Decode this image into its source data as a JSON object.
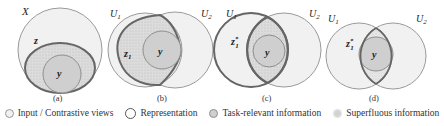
{
  "colors": {
    "input_fill": "#f1f1f1",
    "input_stroke": "#9a9a9a",
    "representation_stroke": "#666666",
    "task_fill": "#cfcfcf",
    "task_stroke": "#8f8f8f",
    "superfluous_fill": "#dedede"
  },
  "panels": [
    {
      "caption": "(a)",
      "labels": {
        "outer": "X",
        "representation": "z",
        "task": "y"
      }
    },
    {
      "caption": "(b)",
      "labels": {
        "view1": "U",
        "view1_sub": "1",
        "view2": "U",
        "view2_sub": "2",
        "representation": "z",
        "representation_sub": "1",
        "task": "y"
      }
    },
    {
      "caption": "(c)",
      "labels": {
        "view1": "U",
        "view1_sub": "1",
        "view2": "U",
        "view2_sub": "2",
        "representation": "z",
        "representation_sub": "1",
        "representation_sup": "*",
        "task": "y"
      }
    },
    {
      "caption": "(d)",
      "labels": {
        "view1": "U",
        "view1_sub": "1",
        "view2": "U",
        "view2_sub": "2",
        "representation": "z",
        "representation_sub": "1",
        "representation_sup": "*",
        "task": "y"
      }
    }
  ],
  "legend": [
    {
      "key": "input",
      "label": "Input / Contrastive views"
    },
    {
      "key": "representation",
      "label": "Representation"
    },
    {
      "key": "task",
      "label": "Task-relevant information"
    },
    {
      "key": "superfluous",
      "label": "Superfluous information"
    }
  ]
}
